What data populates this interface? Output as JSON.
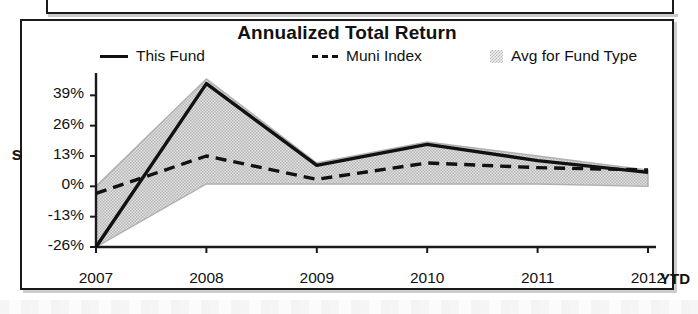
{
  "chart": {
    "title": "Annualized Total Return",
    "ytd_label": "YTD",
    "left_margin_fragment": "s"
  },
  "legend": {
    "items": [
      {
        "label": "This Fund",
        "swatch": "solid-line-swatch"
      },
      {
        "label": "Muni Index",
        "swatch": "dashed-line-swatch"
      },
      {
        "label": "Avg for Fund Type",
        "swatch": "shaded-area-swatch"
      }
    ]
  },
  "chart_data": {
    "type": "line",
    "title": "Annualized Total Return",
    "xlabel": "",
    "ylabel": "",
    "x": [
      "2007",
      "2008",
      "2009",
      "2010",
      "2011",
      "2012"
    ],
    "categories": [
      "2007",
      "2008",
      "2009",
      "2010",
      "2011",
      "2012"
    ],
    "ytick_labels": [
      "39%",
      "26%",
      "13%",
      "0%",
      "-13%",
      "-26%"
    ],
    "ytick_values": [
      39,
      26,
      13,
      0,
      -13,
      -26
    ],
    "ylim": [
      -26,
      46
    ],
    "grid": false,
    "legend_position": "top",
    "series": [
      {
        "name": "This Fund",
        "style": "solid",
        "color": "#111111",
        "values": [
          -26,
          44,
          9,
          18,
          11,
          6
        ]
      },
      {
        "name": "Muni Index",
        "style": "dashed",
        "color": "#111111",
        "values": [
          -3,
          13,
          3,
          10,
          8,
          7
        ]
      },
      {
        "name": "Avg for Fund Type",
        "style": "shaded-band",
        "color": "#cfcfcf",
        "upper": [
          0,
          46,
          10,
          19,
          13,
          7
        ],
        "lower": [
          -26,
          1,
          1,
          1,
          1,
          0
        ]
      }
    ],
    "annotations": [
      "YTD"
    ]
  }
}
